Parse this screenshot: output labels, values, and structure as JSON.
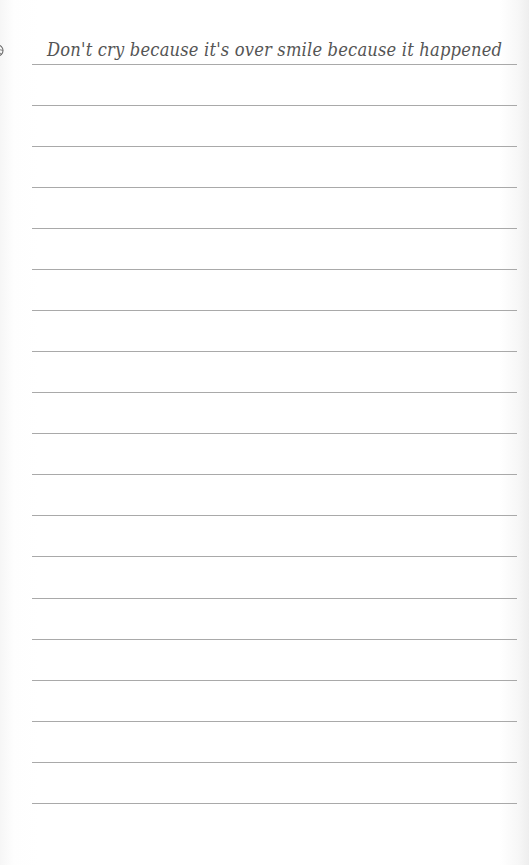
{
  "page": {
    "type": "lined-notebook-page",
    "header": {
      "quote": "Don't cry because it's over smile because it happened",
      "left_icon": "flower-spiral-icon",
      "right_icon": "flower-spiral-icon"
    },
    "ruled_lines": {
      "count": 19,
      "positions_y": [
        64,
        105,
        146,
        187,
        228,
        269,
        310,
        351,
        392,
        433,
        474,
        515,
        556,
        598,
        639,
        680,
        721,
        762,
        803
      ]
    },
    "colors": {
      "paper": "#fdfdfd",
      "line": "#9a9a9a",
      "text": "#555555"
    }
  }
}
